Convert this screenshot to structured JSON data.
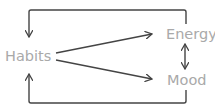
{
  "diagram": {
    "type": "causal-loop",
    "colors": {
      "node_text": "#a9a9a9",
      "edge": "#444444",
      "background": "#ffffff"
    },
    "nodes": [
      {
        "id": "habits",
        "label": "Habits"
      },
      {
        "id": "energy",
        "label": "Energy"
      },
      {
        "id": "mood",
        "label": "Mood"
      }
    ],
    "edges": [
      {
        "from": "habits",
        "to": "energy",
        "direction": "forward"
      },
      {
        "from": "habits",
        "to": "mood",
        "direction": "forward"
      },
      {
        "from": "energy",
        "to": "mood",
        "direction": "bidirectional"
      },
      {
        "from": "energy",
        "to": "habits",
        "direction": "forward",
        "route": "top-loop"
      },
      {
        "from": "mood",
        "to": "habits",
        "direction": "forward",
        "route": "bottom-loop"
      }
    ]
  }
}
